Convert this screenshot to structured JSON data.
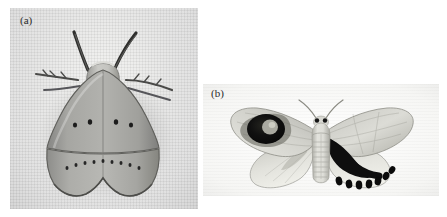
{
  "figure": {
    "caption_panels": [
      {
        "id": "a",
        "label": "(a)",
        "description": "moth at rest with wings folded over body, cryptic grey colouration, raised antennae and outstretched forelegs, rows of small dark spots across forewing and hindwing, resting on pale woven fabric background"
      },
      {
        "id": "b",
        "label": "(b)",
        "description": "moth with wings spread open in deimatic display, left forewing bearing a large dark eyespot with pale centre, right hindwing bearing a bold black wedge band edged with a row of rounded black lobes, segmented pale abdomen and dark eyes"
      }
    ]
  },
  "panel_a": {
    "label": "(a)",
    "background_color": "#e8e8e6",
    "wing_color": "#9a9a98",
    "body_color": "#b9b9b5",
    "spot_color": "#1c1c1c",
    "forewing_spot_count": 4,
    "hindwing_spot_count": 9,
    "antenna_count": 2,
    "leg_count": 4
  },
  "panel_b": {
    "label": "(b)",
    "background_color": "#fcfcfb",
    "wing_color": "#cfcfca",
    "body_color": "#d8d8d2",
    "eyespot_color": "#121212",
    "eyespot_pupil_color": "#b8b8ae",
    "black_band_color": "#0d0d0d",
    "lobe_count": 7,
    "eye_count": 2,
    "abdomen_segment_count": 8
  },
  "colors": {
    "page_background": "#ffffff",
    "label_text": "#2a2a2a",
    "dark_marking": "#0d0d0d"
  }
}
